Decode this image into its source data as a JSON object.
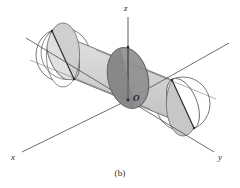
{
  "figure": {
    "caption": "(b)",
    "caption_position": {
      "x": 118,
      "y": 171
    },
    "background_color": "#ffffff",
    "labels": {
      "x_axis": "x",
      "y_axis": "y",
      "z_axis": "z",
      "origin": "O"
    },
    "label_positions": {
      "x_axis": {
        "x": 13,
        "y": 158
      },
      "y_axis": {
        "x": 219,
        "y": 158
      },
      "z_axis": {
        "x": 124,
        "y": 11
      },
      "origin": {
        "x": 133,
        "y": 100
      }
    },
    "colors": {
      "stroke": "#4a4a4a",
      "stroke_dark": "#2f2f2f",
      "cylinder_light": "#d9d9d9",
      "cylinder_mid": "#c4c4c4",
      "plane_fill": "#bdbdbd",
      "disk_dark": "#8c8c8c",
      "cap_white": "#ffffff",
      "text": "#2b2b2b"
    },
    "geometry": {
      "description": "cylinder-with-intersecting-circular-disk",
      "axes": {
        "z": {
          "from": {
            "x": 128,
            "y": 18
          },
          "to": {
            "x": 128,
            "y": 100
          }
        },
        "x": {
          "from": {
            "x": 22,
            "y": 152
          },
          "to": {
            "x": 128,
            "y": 100
          }
        },
        "y": {
          "from": {
            "x": 128,
            "y": 100
          },
          "to": {
            "x": 214,
            "y": 152
          }
        },
        "cyl_axis_left": {
          "x": 25,
          "y": 36
        },
        "cyl_axis_right": {
          "x": 228,
          "y": 43
        }
      },
      "cylinder": {
        "left_center": {
          "x": 60,
          "y": 52
        },
        "right_center": {
          "x": 186,
          "y": 104
        },
        "radius_x": 15,
        "radius_y": 30,
        "tilt_deg": -20
      },
      "disk": {
        "center": {
          "x": 128,
          "y": 78
        },
        "radius_x": 20,
        "radius_y": 30,
        "tilt_deg": -15
      }
    }
  }
}
